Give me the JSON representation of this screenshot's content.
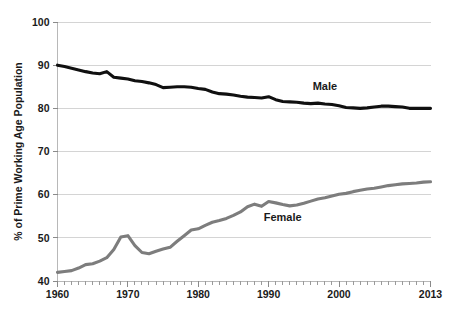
{
  "chart_data": {
    "type": "line",
    "title": "",
    "xlabel": "",
    "ylabel": "% of Prime Working Age Population",
    "xlim": [
      1960,
      2013
    ],
    "ylim": [
      40,
      100
    ],
    "grid": true,
    "legend_position": "inline-annotation",
    "y_ticks": [
      40,
      50,
      60,
      70,
      80,
      90,
      100
    ],
    "x_ticks": [
      1960,
      1970,
      1980,
      1990,
      2000,
      2013
    ],
    "x_minor_tick_interval": 1,
    "x": [
      1960,
      1961,
      1962,
      1963,
      1964,
      1965,
      1966,
      1967,
      1968,
      1969,
      1970,
      1971,
      1972,
      1973,
      1974,
      1975,
      1976,
      1977,
      1978,
      1979,
      1980,
      1981,
      1982,
      1983,
      1984,
      1985,
      1986,
      1987,
      1988,
      1989,
      1990,
      1991,
      1992,
      1993,
      1994,
      1995,
      1996,
      1997,
      1998,
      1999,
      2000,
      2001,
      2002,
      2003,
      2004,
      2005,
      2006,
      2007,
      2008,
      2009,
      2010,
      2011,
      2012,
      2013
    ],
    "series": [
      {
        "name": "Male",
        "color": "#101010",
        "stroke_width": 3.1,
        "label_x": 1998,
        "label_y": 84.2,
        "values": [
          90.0,
          89.7,
          89.3,
          88.9,
          88.5,
          88.2,
          88.0,
          88.5,
          87.2,
          87.0,
          86.8,
          86.4,
          86.2,
          85.9,
          85.5,
          84.8,
          84.9,
          85.0,
          85.0,
          84.9,
          84.6,
          84.4,
          83.8,
          83.4,
          83.3,
          83.1,
          82.8,
          82.6,
          82.5,
          82.4,
          82.7,
          82.0,
          81.6,
          81.5,
          81.4,
          81.2,
          81.1,
          81.2,
          81.0,
          80.9,
          80.6,
          80.2,
          80.1,
          80.0,
          80.1,
          80.3,
          80.5,
          80.5,
          80.4,
          80.3,
          80.0,
          80.0,
          80.0,
          80.0
        ]
      },
      {
        "name": "Female",
        "color": "#7d7d7d",
        "stroke_width": 3.1,
        "label_x": 1992,
        "label_y": 54.0,
        "values": [
          42.0,
          42.2,
          42.4,
          43.0,
          43.8,
          44.0,
          44.6,
          45.4,
          47.3,
          50.2,
          50.5,
          48.2,
          46.6,
          46.3,
          46.9,
          47.4,
          47.8,
          49.2,
          50.5,
          51.8,
          52.1,
          52.9,
          53.6,
          54.0,
          54.5,
          55.2,
          56.0,
          57.2,
          57.8,
          57.3,
          58.4,
          58.1,
          57.7,
          57.4,
          57.6,
          58.0,
          58.5,
          59.0,
          59.3,
          59.7,
          60.1,
          60.3,
          60.7,
          61.0,
          61.3,
          61.5,
          61.8,
          62.1,
          62.3,
          62.5,
          62.6,
          62.7,
          62.9,
          63.0
        ]
      }
    ]
  },
  "axis": {
    "y_title": "% of Prime Working Age Population",
    "y_tick_labels": [
      "100",
      "90",
      "80",
      "70",
      "60",
      "50",
      "40"
    ],
    "x_tick_labels": [
      "1960",
      "1970",
      "1980",
      "1990",
      "2000",
      "2013"
    ]
  },
  "annotations": {
    "male_label": "Male",
    "female_label": "Female"
  },
  "colors": {
    "male_series": "#101010",
    "female_series": "#7d7d7d",
    "gridline": "#d4d4d4",
    "axis": "#b8b8b8",
    "background": "#ffffff",
    "text": "#1a1a1a"
  }
}
